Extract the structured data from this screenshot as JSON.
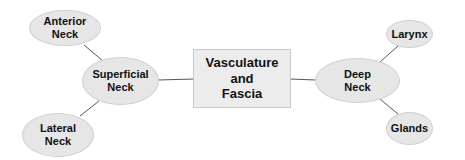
{
  "diagram": {
    "center": {
      "label_lines": [
        "Vasculature",
        "and",
        "Fascia"
      ]
    },
    "nodes": {
      "superficial": {
        "label_lines": [
          "Superficial",
          "Neck"
        ]
      },
      "anterior": {
        "label_lines": [
          "Anterior",
          "Neck"
        ]
      },
      "lateral": {
        "label_lines": [
          "Lateral",
          "Neck"
        ]
      },
      "deep": {
        "label_lines": [
          "Deep",
          "Neck"
        ]
      },
      "larynx": {
        "label_lines": [
          "Larynx"
        ]
      },
      "glands": {
        "label_lines": [
          "Glands"
        ]
      }
    },
    "colors": {
      "node_fill": "#e6e6e6",
      "line": "#555555"
    }
  }
}
